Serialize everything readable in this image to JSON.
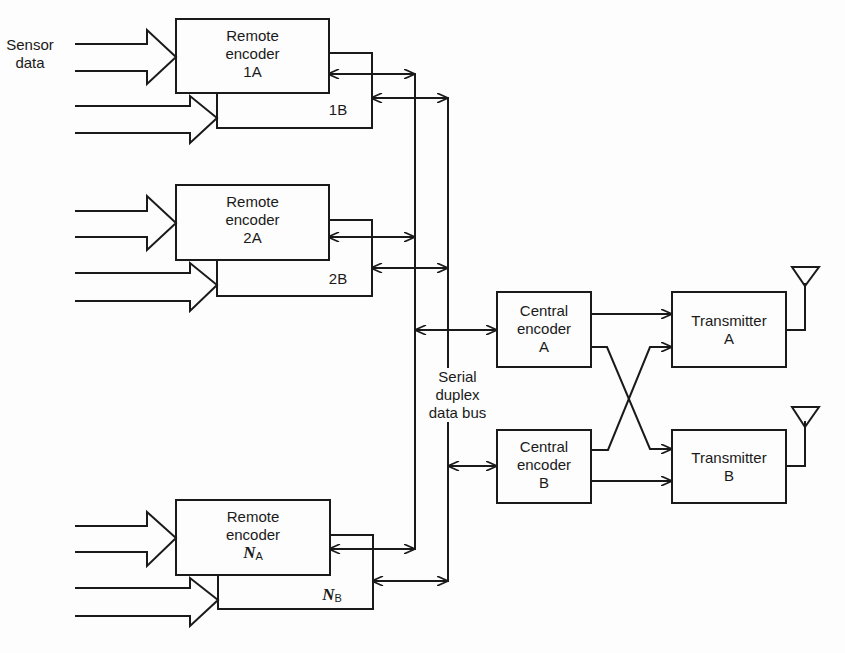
{
  "diagram": {
    "input_label": [
      "Sensor",
      "data"
    ],
    "remote_encoders": [
      {
        "id": "1",
        "a_label": [
          "Remote",
          "encoder",
          "1A"
        ],
        "b_label": "1B"
      },
      {
        "id": "2",
        "a_label": [
          "Remote",
          "encoder",
          "2A"
        ],
        "b_label": "2B"
      },
      {
        "id": "N",
        "a_label": [
          "Remote",
          "encoder",
          "N",
          "A"
        ],
        "b_label": [
          "N",
          "B"
        ]
      }
    ],
    "bus_label": [
      "Serial",
      "duplex",
      "data bus"
    ],
    "central_encoders": [
      {
        "label": [
          "Central",
          "encoder",
          "A"
        ]
      },
      {
        "label": [
          "Central",
          "encoder",
          "B"
        ]
      }
    ],
    "transmitters": [
      {
        "label": [
          "Transmitter",
          "A"
        ]
      },
      {
        "label": [
          "Transmitter",
          "B"
        ]
      }
    ],
    "colors": {
      "line": "#1a1a1a",
      "background": "#fdfdfd"
    }
  }
}
